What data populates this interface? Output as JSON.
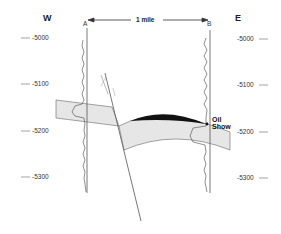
{
  "diagram": {
    "type": "geologic-cross-section",
    "directions": {
      "west": "W",
      "east": "E"
    },
    "wells": [
      {
        "id": "A",
        "label": "A",
        "side": "west"
      },
      {
        "id": "B",
        "label": "B",
        "side": "east"
      }
    ],
    "scale": {
      "label": "1 mile",
      "between": [
        "A",
        "B"
      ]
    },
    "depth_labels_left": [
      "-5000",
      "-5100",
      "-5200",
      "-5300"
    ],
    "depth_labels_right": [
      "-5000",
      "-5100",
      "-5200",
      "-5300"
    ],
    "annotation": {
      "line1": "Oil",
      "line2": "Show",
      "well": "B"
    },
    "features": [
      "reservoir-bed",
      "normal-fault",
      "oil-accumulation"
    ],
    "colors": {
      "bed_fill": "#e6e6e6",
      "oil_fill": "#111111",
      "line": "#555555"
    }
  }
}
